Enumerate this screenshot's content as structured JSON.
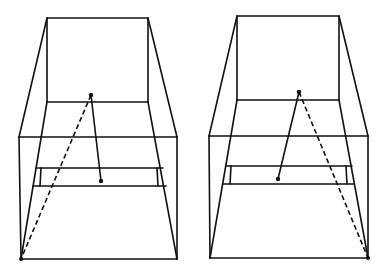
{
  "diagram": {
    "type": "perspective-box-illustration",
    "stroke_color": "#111111",
    "background": "#ffffff",
    "figures": [
      {
        "id": "left",
        "back_wall": {
          "x1": 47,
          "y1": 18,
          "x2": 148,
          "y2": 102
        },
        "front_top_y": 137,
        "front_left_x": 19,
        "front_right_x": 177,
        "bottom_y": 259,
        "bottom_left_x": 21,
        "bottom_right_x": 177,
        "shelf": {
          "upper_y": 168,
          "lower_y": 186,
          "left_x": 35,
          "right_x": 164
        },
        "points": {
          "apex": [
            91,
            95
          ],
          "solid_end": [
            101,
            181
          ],
          "dashed_end": [
            21,
            259
          ]
        },
        "dashed_side": "left"
      },
      {
        "id": "right",
        "back_wall": {
          "x1": 237,
          "y1": 16,
          "x2": 339,
          "y2": 100
        },
        "front_top_y": 136,
        "front_left_x": 209,
        "front_right_x": 368,
        "bottom_y": 258,
        "bottom_left_x": 210,
        "bottom_right_x": 368,
        "shelf": {
          "upper_y": 166,
          "lower_y": 184,
          "left_x": 225,
          "right_x": 353
        },
        "points": {
          "apex": [
            299,
            92
          ],
          "solid_end": [
            278,
            179
          ],
          "dashed_end": [
            368,
            258
          ]
        },
        "dashed_side": "right"
      }
    ]
  }
}
